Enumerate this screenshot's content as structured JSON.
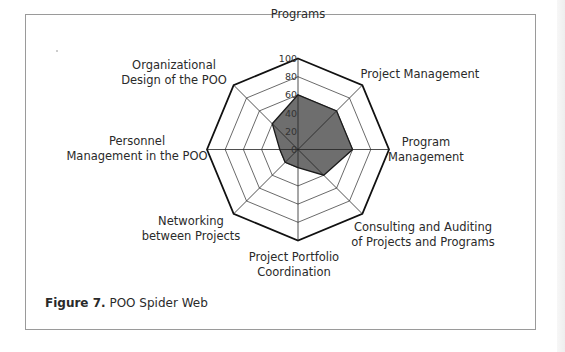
{
  "figure": {
    "caption_number": "Figure 7.",
    "caption_text": " POO Spider Web"
  },
  "chart_data": {
    "type": "radar",
    "title": "POO Spider Web",
    "categories": [
      "Programs",
      "Project Management",
      "Program Management",
      "Consulting and Auditing of Projects and Programs",
      "Project Portfolio Coordination",
      "Networking between Projects",
      "Personnel Management in the POO",
      "Organizational Design of the POO"
    ],
    "category_label_lines": [
      [
        "Programs"
      ],
      [
        "Project Management"
      ],
      [
        "Program",
        "Management"
      ],
      [
        "Consulting and Auditing",
        "of Projects and Programs"
      ],
      [
        "Project Portfolio",
        "Coordination"
      ],
      [
        "Networking",
        "between Projects"
      ],
      [
        "Personnel",
        "Management in the POO"
      ],
      [
        "Organizational",
        "Design of the POO"
      ]
    ],
    "series": [
      {
        "name": "POO",
        "values": [
          60,
          60,
          60,
          40,
          20,
          20,
          20,
          40
        ],
        "fill": "#6e6e6e",
        "stroke": "#1a1a1a"
      }
    ],
    "rlim": [
      0,
      100
    ],
    "ticks": [
      "0",
      "20",
      "40",
      "60",
      "80",
      "100"
    ],
    "grid": true,
    "legend": "none",
    "colors": {
      "grid": "#444444",
      "outer": "#111111",
      "fill": "#6e6e6e"
    }
  }
}
